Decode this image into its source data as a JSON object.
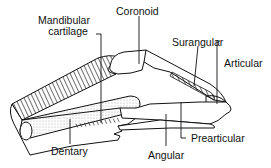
{
  "diagram": {
    "labels": {
      "mandibular_cartilage_line1": "Mandibular",
      "mandibular_cartilage_line2": "cartilage",
      "coronoid": "Coronoid",
      "surangular": "Surangular",
      "articular": "Articular",
      "prearticular": "Prearticular",
      "angular": "Angular",
      "dentary": "Dentary"
    },
    "colors": {
      "line": "#111111",
      "stipple": "#555555",
      "background": "#ffffff"
    }
  }
}
